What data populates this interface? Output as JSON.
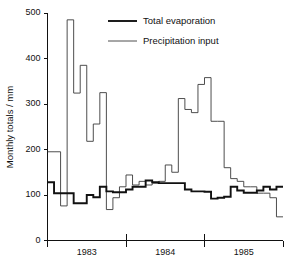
{
  "chart_data": {
    "type": "line",
    "title": "",
    "subtitle": "",
    "xlabel": "",
    "ylabel": "Monthly totals / mm",
    "ylim": [
      0,
      500
    ],
    "yticks": [
      0,
      100,
      200,
      300,
      400,
      500
    ],
    "ytick_labels": [
      "0",
      "100",
      "200",
      "300",
      "400",
      "500"
    ],
    "grid": false,
    "step_style": "pre",
    "legend_position": "top-center",
    "x_axis_type": "monthly-categorical",
    "categories": [
      "1983-01",
      "1983-02",
      "1983-03",
      "1983-04",
      "1983-05",
      "1983-06",
      "1983-07",
      "1983-08",
      "1983-09",
      "1983-10",
      "1983-11",
      "1983-12",
      "1984-01",
      "1984-02",
      "1984-03",
      "1984-04",
      "1984-05",
      "1984-06",
      "1984-07",
      "1984-08",
      "1984-09",
      "1984-10",
      "1984-11",
      "1984-12",
      "1985-01",
      "1985-02",
      "1985-03",
      "1985-04",
      "1985-05",
      "1985-06",
      "1985-07",
      "1985-08",
      "1985-09",
      "1985-10",
      "1985-11",
      "1985-12"
    ],
    "year_groups": [
      {
        "label": "1983",
        "start_index": 0,
        "end_index": 11
      },
      {
        "label": "1984",
        "start_index": 12,
        "end_index": 23
      },
      {
        "label": "1985",
        "start_index": 24,
        "end_index": 35
      }
    ],
    "xtick_labels": [
      "1983",
      "1984",
      "1985"
    ],
    "series": [
      {
        "name": "Total evaporation",
        "line_weight": "thick",
        "color": "#111111",
        "values": [
          128,
          104,
          104,
          104,
          82,
          82,
          100,
          95,
          118,
          108,
          106,
          106,
          112,
          118,
          118,
          132,
          128,
          126,
          126,
          126,
          126,
          112,
          108,
          108,
          107,
          92,
          94,
          96,
          118,
          110,
          105,
          105,
          110,
          118,
          112,
          118
        ]
      },
      {
        "name": "Precipitation input",
        "line_weight": "thin",
        "color": "#3a3a3a",
        "values": [
          195,
          195,
          76,
          485,
          324,
          385,
          218,
          256,
          325,
          68,
          94,
          118,
          144,
          122,
          130,
          122,
          126,
          130,
          166,
          150,
          312,
          288,
          281,
          343,
          358,
          262,
          262,
          160,
          136,
          130,
          118,
          118,
          104,
          104,
          94,
          52
        ]
      }
    ],
    "legend": [
      {
        "label": "Total evaporation",
        "weight": "thick"
      },
      {
        "label": "Precipitation input",
        "weight": "thin"
      }
    ]
  }
}
